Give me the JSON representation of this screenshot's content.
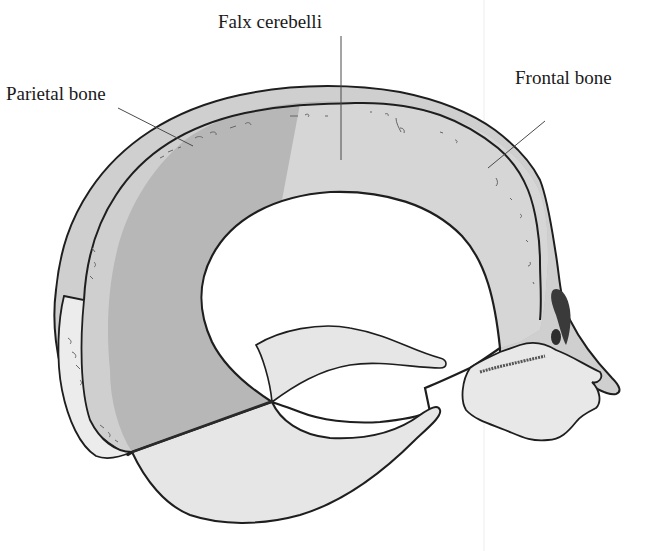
{
  "figure": {
    "type": "anatomical-illustration",
    "labels": {
      "falx_cerebelli": "Falx cerebelli",
      "parietal_bone": "Parietal bone",
      "frontal_bone": "Frontal bone"
    },
    "colors": {
      "outline": "#1e1e1e",
      "bone_fill": "#cfcfcf",
      "falx_dark_fill": "#b7b7b7",
      "membrane_light_fill": "#e6e6e6",
      "background": "#ffffff",
      "leader_line": "#4a4a4a"
    }
  }
}
